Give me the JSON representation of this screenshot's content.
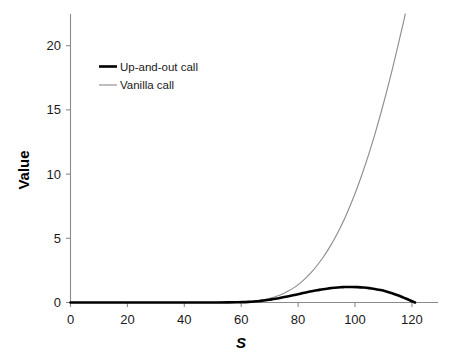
{
  "chart_data": {
    "type": "line",
    "title": "",
    "xlabel": "S",
    "ylabel": "Value",
    "xlim": [
      0,
      128
    ],
    "ylim": [
      0,
      22.3
    ],
    "grid": false,
    "legend_position": "upper-left-inside",
    "xticks": [
      "0",
      "20",
      "40",
      "60",
      "80",
      "100",
      "120"
    ],
    "xtick_values": [
      0,
      20,
      40,
      60,
      80,
      100,
      120
    ],
    "yticks": [
      "0",
      "5",
      "10",
      "15",
      "20"
    ],
    "ytick_values": [
      0,
      5,
      10,
      15,
      20
    ],
    "colors": {
      "up_and_out_call": "#000000",
      "vanilla_call": "#8e8e8e",
      "axis": "#8a8a8a",
      "text": "#1a1a1a"
    },
    "series": [
      {
        "name": "Up-and-out call",
        "color": "#000000",
        "linewidth": 2.6,
        "x": [
          0,
          5,
          10,
          15,
          20,
          25,
          30,
          35,
          40,
          45,
          50,
          55,
          58,
          60,
          62,
          64,
          66,
          68,
          70,
          72,
          74,
          76,
          78,
          80,
          82,
          84,
          86,
          88,
          90,
          92,
          94,
          95,
          96,
          98,
          100,
          102,
          104,
          106,
          108,
          110,
          112,
          114,
          116,
          118,
          120
        ],
        "y": [
          0,
          0,
          0,
          0,
          0,
          0,
          0,
          0,
          0,
          0,
          0.002,
          0.01,
          0.02,
          0.03,
          0.05,
          0.08,
          0.12,
          0.17,
          0.24,
          0.31,
          0.4,
          0.49,
          0.58,
          0.68,
          0.78,
          0.87,
          0.95,
          1.03,
          1.09,
          1.14,
          1.18,
          1.19,
          1.2,
          1.2,
          1.19,
          1.16,
          1.11,
          1.04,
          0.96,
          0.85,
          0.72,
          0.56,
          0.38,
          0.19,
          0
        ]
      },
      {
        "name": "Vanilla call",
        "color": "#8e8e8e",
        "linewidth": 1.15,
        "x": [
          0,
          5,
          10,
          15,
          20,
          25,
          30,
          35,
          40,
          45,
          50,
          55,
          58,
          60,
          62,
          64,
          66,
          68,
          70,
          72,
          74,
          76,
          78,
          80,
          82,
          84,
          86,
          88,
          90,
          92,
          94,
          96,
          98,
          100,
          102,
          104,
          106,
          108,
          110,
          112,
          114,
          116,
          118
        ],
        "y": [
          0,
          0,
          0,
          0,
          0,
          0,
          0,
          0,
          0,
          0,
          0.002,
          0.012,
          0.025,
          0.04,
          0.07,
          0.11,
          0.17,
          0.25,
          0.36,
          0.5,
          0.68,
          0.9,
          1.17,
          1.5,
          1.9,
          2.36,
          2.9,
          3.5,
          4.18,
          4.95,
          5.8,
          6.75,
          7.8,
          8.95,
          10.2,
          11.55,
          13.0,
          14.55,
          16.2,
          17.95,
          19.8,
          21.7,
          23.7
        ]
      }
    ],
    "annotations": {
      "barrier_level": 120,
      "barrier_note": "Up-and-out call value knocks to zero at the barrier"
    }
  },
  "legend": {
    "entries": [
      {
        "label": "Up-and-out call"
      },
      {
        "label": "Vanilla call"
      }
    ]
  },
  "axes": {
    "x_title": "S",
    "y_title": "Value"
  }
}
